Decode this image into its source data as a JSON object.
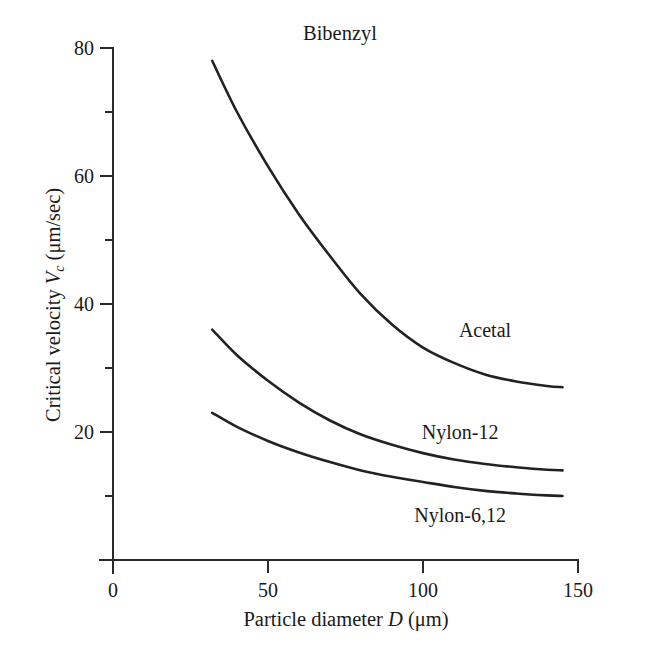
{
  "chart_data": {
    "type": "line",
    "title": "Bibenzyl",
    "xlabel": "Particle diameter D (μm)",
    "ylabel": "Critical velocity V_c (μm/sec)",
    "xlabel_parts": {
      "pre": "Particle diameter ",
      "var": "D",
      "post": " (μm)"
    },
    "ylabel_parts": {
      "pre": "Critical velocity ",
      "var": "V",
      "sub": "c",
      "post": " (μm/sec)"
    },
    "xlim": [
      0,
      150
    ],
    "ylim": [
      0,
      80
    ],
    "xticks": [
      0,
      50,
      100,
      150
    ],
    "xticklabels": [
      "0",
      "50",
      "100",
      "150"
    ],
    "yticks": [
      20,
      40,
      60,
      80
    ],
    "yticklabels": [
      "20",
      "40",
      "60",
      "80"
    ],
    "yticks_minor": [
      10,
      30,
      50,
      70
    ],
    "grid": false,
    "legend_position": "inline-curve-labels",
    "series": [
      {
        "name": "Acetal",
        "label_x": 120,
        "label_y": 36,
        "x": [
          32,
          40,
          50,
          60,
          70,
          80,
          90,
          100,
          110,
          120,
          130,
          140,
          145
        ],
        "y": [
          78.0,
          70.0,
          61.5,
          54.0,
          47.5,
          41.5,
          36.8,
          33.2,
          30.8,
          29.0,
          27.9,
          27.2,
          27.0
        ]
      },
      {
        "name": "Nylon-12",
        "label_x": 112,
        "label_y": 20,
        "x": [
          32,
          40,
          50,
          60,
          70,
          80,
          90,
          100,
          110,
          120,
          130,
          140,
          145
        ],
        "y": [
          36.0,
          32.0,
          28.0,
          24.6,
          21.8,
          19.6,
          18.0,
          16.7,
          15.7,
          15.0,
          14.5,
          14.1,
          14.0
        ]
      },
      {
        "name": "Nylon-6,12",
        "label_x": 112,
        "label_y": 7,
        "x": [
          32,
          40,
          50,
          60,
          70,
          80,
          90,
          100,
          110,
          120,
          130,
          140,
          145
        ],
        "y": [
          23.0,
          20.8,
          18.6,
          16.8,
          15.3,
          14.0,
          13.0,
          12.2,
          11.4,
          10.8,
          10.4,
          10.1,
          10.0
        ]
      }
    ]
  },
  "axis_label_colors": {
    "ink": "#1a1a1a",
    "curve": "#222222"
  }
}
